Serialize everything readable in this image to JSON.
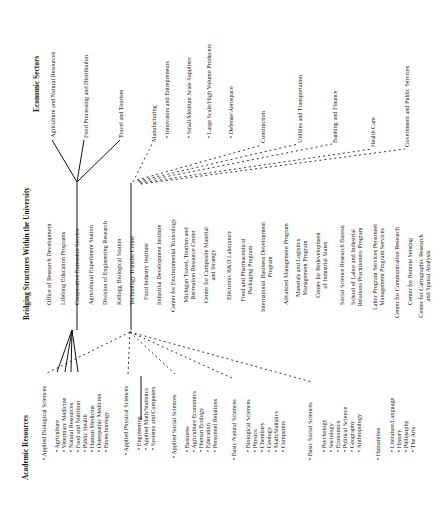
{
  "diagram": {
    "orientation": "rotated-90-ccw",
    "columns": {
      "economic_sectors": {
        "title": "Economic Sectors",
        "items": [
          "Agriculture and Natural Resources",
          "Food Processing and Distribution",
          "Travel and Tourism",
          "Manufacturing",
          "• Innovators and Entrepreneurs",
          "• Small/Medium Scale Suppliers",
          "• Large Scale/High Volume Producers",
          "• Defense/Aerospace",
          "Construction",
          "Utilities and Transportation",
          "Banking and Finance",
          "Health Care",
          "Government and Public Services"
        ]
      },
      "bridging_structures": {
        "title": "Bridging Structures Within the University",
        "items": [
          "Office of Research Development",
          "Lifelong Education Programs",
          "Cooperative Extension Service",
          "Agricultural Experiment Station",
          "Division of Engineering Research",
          "Kellogg Biological Station",
          "Technology Transfer Center",
          "Food Industry Institute",
          "Industrial Development Institute",
          "Center for Environmental Toxicology",
          "Michigan Travel, Tourism and Recreation Resource Center",
          "Center for Composite Material and Strategy",
          "Electronic R&D Laboratory",
          "Food and Pharmaceutical Packaging Program",
          "International Business Development Program",
          "Advanced Management Program",
          "Materials and Logistics Management Program",
          "Center for Redevelopment of Industrial States",
          "Social Science Research Bureau",
          "School of Labor and Industrial Relations Practitioners Program",
          "Labor Program Services Personnel Management Program Services",
          "Center for Communication Research",
          "Center for Remote Sensing",
          "Center for Cartographic Research and Spatial Analysis"
        ]
      },
      "academic_resources": {
        "title": "Academic Resources",
        "groups": [
          {
            "label": "• Applied Biological Sciences",
            "items": [
              "• Agriculture",
              "• Veterinary Medicine",
              "• Natural Resources",
              "• Food and Nutrition",
              "• Public Health",
              "• Human Medicine",
              "• Osteopathic Medicine",
              "• Biotechnology"
            ]
          },
          {
            "label": "• Applied Physical Sciences",
            "items": [
              "• Engineering",
              "• Applied Math/Statistics",
              "• Systems and Computers"
            ]
          },
          {
            "label": "• Applied Social Sciences",
            "items": [
              "• Business",
              "• Agriculture Economics",
              "• Human Ecology",
              "• Education",
              "• Personnel Relations"
            ]
          },
          {
            "label": "• Basic Natural Sciences",
            "items": [
              "• Biological Sciences",
              "• Physics",
              "• Chemistry",
              "• Geology",
              "• Math/Statistics",
              "• Computers"
            ]
          },
          {
            "label": "• Basic Social Sciences",
            "items": [
              "• Psychology",
              "• Sociology",
              "• Economics",
              "• Political Science",
              "• Geography",
              "• Anthropology"
            ]
          },
          {
            "label": "• Humanities",
            "items": [
              "• Literature/Language",
              "• History",
              "• Philosophy",
              "• The Arts"
            ]
          }
        ]
      }
    }
  }
}
